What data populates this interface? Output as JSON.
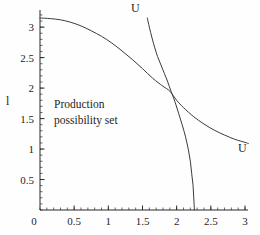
{
  "chart_data": {
    "type": "line",
    "title": "",
    "xlabel": "",
    "ylabel": "l",
    "xlim": [
      0,
      3.1
    ],
    "ylim": [
      0,
      3.3
    ],
    "grid": false,
    "legend": "none",
    "x_ticks": [
      "0",
      "0.5",
      "1",
      "1.5",
      "2",
      "2.5",
      "3"
    ],
    "x_tick_values": [
      0,
      0.5,
      1,
      1.5,
      2,
      2.5,
      3
    ],
    "y_ticks": [
      "0",
      "0.5",
      "1",
      "1.5",
      "2",
      "2.5",
      "3"
    ],
    "y_tick_values": [
      0,
      0.5,
      1,
      1.5,
      2,
      2.5,
      3
    ],
    "minor_tick_step": 0.1,
    "annotations": [
      {
        "name": "region-annotation",
        "line1": "Production",
        "line2": "possibility set",
        "x": 0.55,
        "y": 1.75
      },
      {
        "name": "label-u-top",
        "text": "U",
        "x": 1.5,
        "y": 3.25
      },
      {
        "name": "label-u-right",
        "text": "U",
        "x": 3.06,
        "y": 1.06
      }
    ],
    "series": [
      {
        "name": "production-possibility-frontier",
        "label": "",
        "color": "#3a3a3a",
        "points": [
          [
            0.0,
            3.15
          ],
          [
            0.15,
            3.14
          ],
          [
            0.3,
            3.12
          ],
          [
            0.45,
            3.08
          ],
          [
            0.6,
            3.02
          ],
          [
            0.75,
            2.94
          ],
          [
            0.9,
            2.85
          ],
          [
            1.05,
            2.74
          ],
          [
            1.2,
            2.61
          ],
          [
            1.35,
            2.47
          ],
          [
            1.5,
            2.32
          ],
          [
            1.65,
            2.16
          ],
          [
            1.8,
            2.03
          ],
          [
            1.9,
            1.95
          ],
          [
            2.0,
            1.8
          ],
          [
            2.1,
            1.68
          ],
          [
            2.25,
            1.53
          ],
          [
            2.4,
            1.41
          ],
          [
            2.55,
            1.31
          ],
          [
            2.7,
            1.23
          ],
          [
            2.85,
            1.16
          ],
          [
            3.0,
            1.11
          ],
          [
            3.05,
            1.09
          ]
        ]
      },
      {
        "name": "indifference-curve-U",
        "label": "U",
        "color": "#3a3a3a",
        "points": [
          [
            1.57,
            3.15
          ],
          [
            1.6,
            3.0
          ],
          [
            1.64,
            2.82
          ],
          [
            1.68,
            2.66
          ],
          [
            1.72,
            2.52
          ],
          [
            1.77,
            2.38
          ],
          [
            1.82,
            2.24
          ],
          [
            1.87,
            2.1
          ],
          [
            1.92,
            1.94
          ],
          [
            1.98,
            1.76
          ],
          [
            2.03,
            1.58
          ],
          [
            2.08,
            1.4
          ],
          [
            2.13,
            1.2
          ],
          [
            2.17,
            1.0
          ],
          [
            2.2,
            0.8
          ],
          [
            2.22,
            0.6
          ],
          [
            2.24,
            0.4
          ],
          [
            2.25,
            0.2
          ],
          [
            2.26,
            0.0
          ]
        ]
      }
    ],
    "tangency_point": {
      "x": 1.9,
      "y": 1.95
    }
  },
  "axes": {
    "origin_label": "0",
    "axis_color": "#2b2b2b"
  }
}
